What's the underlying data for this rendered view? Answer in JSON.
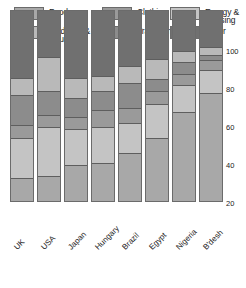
{
  "legend": {
    "items": [
      {
        "label": "Food",
        "color": "#a8a8a8",
        "col": 0,
        "row": 0
      },
      {
        "label": "Medicine &\nEducation",
        "color": "#b9b9b9",
        "col": 0,
        "row": 1
      },
      {
        "label": "Clothing",
        "color": "#9a9a9a",
        "col": 1,
        "row": 0
      },
      {
        "label": "Transport",
        "color": "#8c8c8c",
        "col": 1,
        "row": 1
      },
      {
        "label": "Energy &\nHousing",
        "color": "#c4c4c4",
        "col": 2,
        "row": 0
      },
      {
        "label": "Other",
        "color": "#707070",
        "col": 2,
        "row": 1
      }
    ]
  },
  "chart_data": {
    "type": "bar",
    "stacked": true,
    "stack_total": 100,
    "title": "",
    "xlabel": "",
    "ylabel": "",
    "ylim": [
      0,
      100
    ],
    "yticks": [
      100,
      80,
      60,
      40,
      20
    ],
    "grid": false,
    "legend_position": "top",
    "categories": [
      "UK",
      "USA",
      "Japan",
      "Hungary",
      "Brazil",
      "Egypt",
      "Nigeria",
      "B'desh"
    ],
    "series": [
      {
        "name": "Food",
        "color": "#a8a8a8",
        "values": [
          12,
          13,
          19,
          20,
          25,
          33,
          47,
          57
        ]
      },
      {
        "name": "Energy & Housing",
        "color": "#c4c4c4",
        "values": [
          21,
          26,
          19,
          19,
          16,
          18,
          14,
          12
        ]
      },
      {
        "name": "Clothing",
        "color": "#9a9a9a",
        "values": [
          7,
          6,
          6,
          9,
          8,
          7,
          6,
          5
        ]
      },
      {
        "name": "Transport",
        "color": "#8c8c8c",
        "values": [
          16,
          13,
          10,
          10,
          13,
          6,
          6,
          3
        ]
      },
      {
        "name": "Medicine & Education",
        "color": "#b9b9b9",
        "values": [
          9,
          18,
          11,
          8,
          9,
          11,
          6,
          4
        ]
      },
      {
        "name": "Other",
        "color": "#707070",
        "values": [
          35,
          24,
          35,
          34,
          29,
          25,
          21,
          19
        ]
      }
    ],
    "stack_order_bottom_to_top": [
      "Food",
      "Energy & Housing",
      "Clothing",
      "Transport",
      "Medicine & Education",
      "Other"
    ]
  }
}
